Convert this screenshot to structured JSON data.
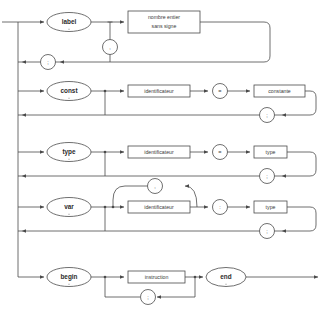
{
  "diagram": {
    "language": "fr",
    "type": "railroad-syntax-diagram",
    "stroke_color": "#4a4a4a",
    "fill_color": "#ffffff",
    "text_color": "#2b2b2b",
    "rows": [
      {
        "id": "label",
        "keyword": "label",
        "items": [
          "nombre entier sans signe"
        ],
        "item_lines": [
          [
            "nombre entier",
            "sans signe"
          ]
        ],
        "separator_symbol": ",",
        "terminator_symbol": ";"
      },
      {
        "id": "const",
        "keyword": "const",
        "items": [
          "identificateur",
          "constante"
        ],
        "assign_symbol": "=",
        "terminator_symbol": ";"
      },
      {
        "id": "type",
        "keyword": "type",
        "items": [
          "identificateur",
          "type"
        ],
        "assign_symbol": "=",
        "terminator_symbol": ";"
      },
      {
        "id": "var",
        "keyword": "var",
        "items": [
          "identificateur",
          "type"
        ],
        "list_symbol": ",",
        "assign_symbol": ":",
        "terminator_symbol": ";"
      },
      {
        "id": "body",
        "keyword_start": "begin",
        "keyword_end": "end",
        "items": [
          "instruction"
        ],
        "separator_symbol": ";"
      }
    ]
  }
}
